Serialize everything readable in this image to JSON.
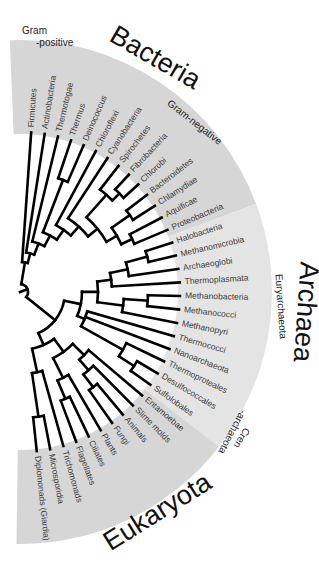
{
  "figure": {
    "type": "phylogenetic-tree",
    "layout": "semicircular-fan",
    "colors": {
      "band": "#d9d9d9",
      "branch": "#000000",
      "text": "#333333",
      "background": "#ffffff"
    }
  },
  "domains": [
    {
      "id": "bacteria",
      "label": "Bacteria"
    },
    {
      "id": "archaea",
      "label": "Archaea"
    },
    {
      "id": "eukaryota",
      "label": "Eukaryota"
    }
  ],
  "groups": [
    {
      "id": "gram-positive",
      "label": "Gram\n-positive",
      "line1": "Gram",
      "line2": "-positive"
    },
    {
      "id": "gram-negative",
      "label": "Gram-negative"
    },
    {
      "id": "euryarchaeota",
      "label": "Euryarchaeota"
    },
    {
      "id": "crenarchaeota",
      "label": "Cren-archaeota",
      "line1": "Cren",
      "line2": "-archaeota"
    }
  ],
  "leaves": [
    {
      "label": "Firmicutes",
      "domain": "bacteria"
    },
    {
      "label": "Actinobacteria",
      "domain": "bacteria"
    },
    {
      "label": "Thermotogae",
      "domain": "bacteria"
    },
    {
      "label": "Thermus",
      "domain": "bacteria"
    },
    {
      "label": "Deinococcus",
      "domain": "bacteria"
    },
    {
      "label": "Chloroflexi",
      "domain": "bacteria"
    },
    {
      "label": "Cyanobacteria",
      "domain": "bacteria"
    },
    {
      "label": "Spirochetes",
      "domain": "bacteria"
    },
    {
      "label": "Fibrobacteria",
      "domain": "bacteria"
    },
    {
      "label": "Chlorobi",
      "domain": "bacteria"
    },
    {
      "label": "Bacteroidetes",
      "domain": "bacteria"
    },
    {
      "label": "Chlamydiae",
      "domain": "bacteria"
    },
    {
      "label": "Aquificae",
      "domain": "bacteria"
    },
    {
      "label": "Proteobacteria",
      "domain": "bacteria"
    },
    {
      "label": "Halobacteria",
      "domain": "archaea"
    },
    {
      "label": "Methanomicrobia",
      "domain": "archaea"
    },
    {
      "label": "Archaeoglobi",
      "domain": "archaea"
    },
    {
      "label": "Thermoplasmata",
      "domain": "archaea"
    },
    {
      "label": "Methanobacteria",
      "domain": "archaea"
    },
    {
      "label": "Methanococci",
      "domain": "archaea"
    },
    {
      "label": "Methanopyri",
      "domain": "archaea"
    },
    {
      "label": "Thermococci",
      "domain": "archaea"
    },
    {
      "label": "Nanoarchaeota",
      "domain": "archaea"
    },
    {
      "label": "Thermoproteales",
      "domain": "archaea"
    },
    {
      "label": "Desulfococcales",
      "domain": "archaea"
    },
    {
      "label": "Sulfolobales",
      "domain": "archaea"
    },
    {
      "label": "Entamoebae",
      "domain": "eukaryota"
    },
    {
      "label": "Slime molds",
      "domain": "eukaryota"
    },
    {
      "label": "Animals",
      "domain": "eukaryota"
    },
    {
      "label": "Fungi",
      "domain": "eukaryota"
    },
    {
      "label": "Plants",
      "domain": "eukaryota"
    },
    {
      "label": "Ciliates",
      "domain": "eukaryota"
    },
    {
      "label": "Flagellates",
      "domain": "eukaryota"
    },
    {
      "label": "Trichomonads",
      "domain": "eukaryota"
    },
    {
      "label": "Microsporidia",
      "domain": "eukaryota"
    },
    {
      "label": "Diplomonads (Giardia)",
      "domain": "eukaryota"
    }
  ]
}
